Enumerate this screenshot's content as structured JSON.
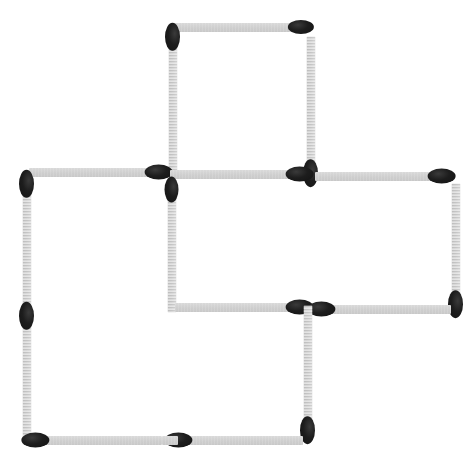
{
  "scene": {
    "title": "Matchstick puzzle figure",
    "description": "Four overlapping squares formed from matchsticks arranged in a pinwheel-like staircase pattern",
    "canvas": {
      "width": 475,
      "height": 462
    },
    "colors": {
      "background": "#ffffff",
      "stick": "#c6c6c6",
      "stick_highlight": "#d2d2d2",
      "head": "#1d1d1d"
    },
    "counts": {
      "matches_total": 16,
      "squares_visible": 4
    }
  },
  "matches": [
    {
      "id": "m01",
      "name": "top-square-top-horizontal",
      "x": 172,
      "y": 27,
      "length": 132,
      "thickness": 9,
      "angle": 0,
      "head": "end",
      "head_w": 26,
      "head_h": 14
    },
    {
      "id": "m02",
      "name": "top-square-left-vertical",
      "x": 173,
      "y": 33,
      "length": 142,
      "thickness": 9,
      "angle": 90,
      "head": "start",
      "head_w": 28,
      "head_h": 15
    },
    {
      "id": "m03",
      "name": "top-square-right-vertical",
      "x": 311,
      "y": 36,
      "length": 140,
      "thickness": 9,
      "angle": 90,
      "head": "end",
      "head_w": 28,
      "head_h": 15
    },
    {
      "id": "m04",
      "name": "upper-left-horizontal",
      "x": 29,
      "y": 172,
      "length": 133,
      "thickness": 9,
      "angle": 0,
      "head": "end",
      "head_w": 28,
      "head_h": 15
    },
    {
      "id": "m05",
      "name": "center-top-horizontal",
      "x": 170,
      "y": 174,
      "length": 133,
      "thickness": 9,
      "angle": 0,
      "head": "end",
      "head_w": 28,
      "head_h": 15
    },
    {
      "id": "m06",
      "name": "right-square-top-horizontal",
      "x": 315,
      "y": 176,
      "length": 130,
      "thickness": 9,
      "angle": 0,
      "head": "end",
      "head_w": 28,
      "head_h": 15
    },
    {
      "id": "m07",
      "name": "left-square-upper-left-vertical",
      "x": 27,
      "y": 180,
      "length": 140,
      "thickness": 9,
      "angle": 90,
      "head": "start",
      "head_w": 28,
      "head_h": 15
    },
    {
      "id": "m08",
      "name": "center-square-left-vertical",
      "x": 172,
      "y": 186,
      "length": 126,
      "thickness": 9,
      "angle": 90,
      "head": "start",
      "head_w": 26,
      "head_h": 14
    },
    {
      "id": "m09",
      "name": "right-square-right-vertical",
      "x": 456,
      "y": 183,
      "length": 124,
      "thickness": 9,
      "angle": 90,
      "head": "end",
      "head_w": 28,
      "head_h": 15
    },
    {
      "id": "m10",
      "name": "left-square-lower-left-vertical",
      "x": 27,
      "y": 312,
      "length": 126,
      "thickness": 9,
      "angle": 90,
      "head": "start",
      "head_w": 28,
      "head_h": 15
    },
    {
      "id": "m11",
      "name": "center-square-bottom-horizontal",
      "x": 175,
      "y": 307,
      "length": 128,
      "thickness": 9,
      "angle": 0,
      "head": "end",
      "head_w": 28,
      "head_h": 15
    },
    {
      "id": "m12",
      "name": "right-square-bottom-horizontal",
      "x": 318,
      "y": 309,
      "length": 133,
      "thickness": 9,
      "angle": 0,
      "head": "start",
      "head_w": 28,
      "head_h": 15
    },
    {
      "id": "m13",
      "name": "center-bottom-vertical",
      "x": 308,
      "y": 305,
      "length": 128,
      "thickness": 9,
      "angle": 90,
      "head": "end",
      "head_w": 28,
      "head_h": 15
    },
    {
      "id": "m14",
      "name": "bottom-left-horizontal",
      "x": 32,
      "y": 440,
      "length": 130,
      "thickness": 9,
      "angle": 0,
      "head": "start",
      "head_w": 28,
      "head_h": 15
    },
    {
      "id": "m15",
      "name": "bottom-right-horizontal",
      "x": 175,
      "y": 440,
      "length": 128,
      "thickness": 9,
      "angle": 0,
      "head": "start",
      "head_w": 28,
      "head_h": 15
    },
    {
      "id": "m16",
      "name": "left-square-bottom-stub",
      "x": 162,
      "y": 440,
      "length": 16,
      "thickness": 9,
      "angle": 0,
      "head": "none",
      "head_w": 0,
      "head_h": 0
    }
  ]
}
